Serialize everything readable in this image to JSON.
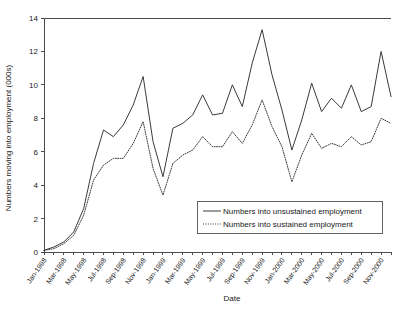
{
  "chart_data": {
    "type": "line",
    "title": "",
    "xlabel": "Date",
    "ylabel": "Numbers moving into employment (000s)",
    "ylim": [
      0,
      14
    ],
    "y_ticks": [
      0,
      2,
      4,
      6,
      8,
      10,
      12,
      14
    ],
    "grid": false,
    "legend_position": "inside-bottom-right",
    "x_tick_labels": [
      "Jan-1998",
      "Mar-1998",
      "May-1998",
      "Jul-1998",
      "Sep-1998",
      "Nov-1998",
      "Jan-1999",
      "Mar-1999",
      "May-1999",
      "Jul-1999",
      "Sep-1999",
      "Nov-1999",
      "Jan-2000",
      "Mar-2000",
      "May-2000",
      "Jul-2000",
      "Sep-2000",
      "Nov-2000"
    ],
    "x": [
      "Jan-1998",
      "Feb-1998",
      "Mar-1998",
      "Apr-1998",
      "May-1998",
      "Jun-1998",
      "Jul-1998",
      "Aug-1998",
      "Sep-1998",
      "Oct-1998",
      "Nov-1998",
      "Dec-1998",
      "Jan-1999",
      "Feb-1999",
      "Mar-1999",
      "Apr-1999",
      "May-1999",
      "Jun-1999",
      "Jul-1999",
      "Aug-1999",
      "Sep-1999",
      "Oct-1999",
      "Nov-1999",
      "Dec-1999",
      "Jan-2000",
      "Feb-2000",
      "Mar-2000",
      "Apr-2000",
      "May-2000",
      "Jun-2000",
      "Jul-2000",
      "Aug-2000",
      "Sep-2000",
      "Oct-2000",
      "Nov-2000",
      "Dec-2000"
    ],
    "series": [
      {
        "name": "Numbers into unsustained employment",
        "style": "solid",
        "color": "#3b3b3b",
        "values": [
          0.1,
          0.3,
          0.6,
          1.2,
          2.6,
          5.3,
          7.3,
          6.9,
          7.6,
          8.8,
          10.5,
          6.6,
          4.5,
          7.4,
          7.7,
          8.2,
          9.4,
          8.2,
          8.3,
          10.0,
          8.7,
          11.3,
          13.3,
          10.6,
          8.5,
          6.1,
          7.9,
          10.1,
          8.4,
          9.2,
          8.6,
          10.0,
          8.4,
          8.7,
          12.0,
          9.3
        ]
      },
      {
        "name": "Numbers into sustained employment",
        "style": "dotted",
        "color": "#3b3b3b",
        "values": [
          0.1,
          0.2,
          0.5,
          1.0,
          2.2,
          4.3,
          5.2,
          5.6,
          5.6,
          6.5,
          7.8,
          5.0,
          3.4,
          5.3,
          5.8,
          6.1,
          6.9,
          6.3,
          6.3,
          7.2,
          6.5,
          7.6,
          9.1,
          7.5,
          6.3,
          4.2,
          5.8,
          7.1,
          6.2,
          6.5,
          6.3,
          6.9,
          6.4,
          6.6,
          8.0,
          7.7
        ]
      }
    ]
  }
}
